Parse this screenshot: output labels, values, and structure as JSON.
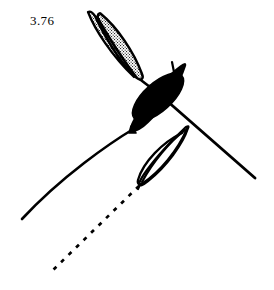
{
  "figure": {
    "label": "3.76",
    "label_position": {
      "x": 30,
      "y": 14
    },
    "background_color": "#ffffff",
    "ink_color": "#000000",
    "stipple_color": "#000000",
    "width": 274,
    "height": 290,
    "caption_style": "figure-number"
  },
  "elements": {
    "stippled_blade_upper": {
      "name": "stippled-blade-upper",
      "fill": "stipple",
      "stroke": "#000000",
      "stroke_width": 2.4,
      "tip_top": {
        "x": 88,
        "y": 12
      },
      "tip_bottom": {
        "x": 136,
        "y": 78
      }
    },
    "stippled_blade_lower": {
      "name": "stippled-blade-lower",
      "fill": "stipple",
      "stroke": "#000000",
      "stroke_width": 2.4,
      "tip_top": {
        "x": 101,
        "y": 13
      },
      "tip_bottom": {
        "x": 140,
        "y": 75
      }
    },
    "solid_black_spindle": {
      "name": "solid-black-spindle",
      "fill": "#000000",
      "stroke": "#000000",
      "tip_top": {
        "x": 185,
        "y": 66
      },
      "tip_bottom": {
        "x": 132,
        "y": 131
      },
      "barb": {
        "x": 172,
        "y": 63
      }
    },
    "open_blade_lower": {
      "name": "open-outlined-blade",
      "fill": "none",
      "stroke": "#000000",
      "stroke_width": 2.2,
      "tip_top": {
        "x": 188,
        "y": 128
      },
      "tip_bottom": {
        "x": 141,
        "y": 184
      }
    },
    "axis_upper": {
      "name": "axis-upper-stem",
      "stroke": "#000000",
      "stroke_width": 2.6,
      "from": {
        "x": 136,
        "y": 78
      },
      "to": {
        "x": 162,
        "y": 96
      }
    },
    "axis_right": {
      "name": "axis-right-branch",
      "stroke": "#000000",
      "stroke_width": 2.8,
      "from": {
        "x": 160,
        "y": 95
      },
      "to": {
        "x": 255,
        "y": 178
      }
    },
    "axis_left_curve": {
      "name": "axis-left-curved-branch",
      "stroke": "#000000",
      "stroke_width": 2.6,
      "from": {
        "x": 134,
        "y": 129
      },
      "to": {
        "x": 22,
        "y": 219
      }
    },
    "dashed_guide_line": {
      "name": "dashed-guide-line",
      "stroke": "#000000",
      "stroke_width": 2.6,
      "dash_pattern": "4 6",
      "from": {
        "x": 140,
        "y": 185
      },
      "to": {
        "x": 50,
        "y": 273
      }
    }
  },
  "chart_data": {
    "type": "diagram",
    "title": "3.76",
    "annotations": [
      "3.76"
    ]
  }
}
